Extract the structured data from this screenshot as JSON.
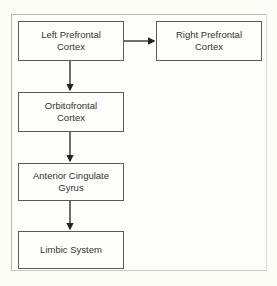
{
  "diagram": {
    "type": "flowchart",
    "nodes": [
      {
        "id": "left_prefrontal",
        "label": "Left Prefrontal\nCortex"
      },
      {
        "id": "right_prefrontal",
        "label": "Right Prefrontal\nCortex"
      },
      {
        "id": "orbitofrontal",
        "label": "Orbitofrontal\nCortex"
      },
      {
        "id": "anterior_cingulate",
        "label": "Anterior Cingulate\nGyrus"
      },
      {
        "id": "limbic",
        "label": "Limbic System"
      }
    ],
    "edges": [
      {
        "from": "left_prefrontal",
        "to": "right_prefrontal"
      },
      {
        "from": "left_prefrontal",
        "to": "orbitofrontal"
      },
      {
        "from": "orbitofrontal",
        "to": "anterior_cingulate"
      },
      {
        "from": "anterior_cingulate",
        "to": "limbic"
      }
    ],
    "colors": {
      "line": "#222222",
      "box_border": "#5a5a5a",
      "frame_border": "#b8b8b0",
      "background": "#fdfdf8"
    }
  }
}
